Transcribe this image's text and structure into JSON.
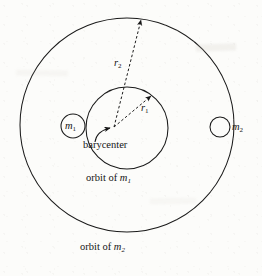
{
  "figure": {
    "background_color": "#fcfcfa",
    "stroke_color": "#1a1a1a"
  },
  "bodies": {
    "primary": {
      "label": "m",
      "subscript": "1",
      "center_x": 73,
      "center_y": 126,
      "radius": 12
    },
    "secondary": {
      "label": "m",
      "subscript": "2",
      "center_x": 220,
      "center_y": 127,
      "radius": 10
    }
  },
  "orbits": {
    "inner": {
      "caption_prefix": "orbit of ",
      "caption_symbol": "m",
      "caption_subscript": "1",
      "center_x": 127,
      "center_y": 128,
      "radius": 41
    },
    "outer": {
      "caption_prefix": "orbit of ",
      "caption_symbol": "m",
      "caption_subscript": "2",
      "center_x": 127,
      "center_y": 125,
      "radius": 107
    }
  },
  "barycenter": {
    "label": "barycenter",
    "x": 114,
    "y": 127
  },
  "radii": {
    "r1": {
      "label": "r",
      "subscript": "1",
      "from_x": 114,
      "from_y": 127,
      "to_x": 151,
      "to_y": 96
    },
    "r2": {
      "label": "r",
      "subscript": "2",
      "from_x": 114,
      "from_y": 127,
      "to_x": 141,
      "to_y": 20
    }
  }
}
